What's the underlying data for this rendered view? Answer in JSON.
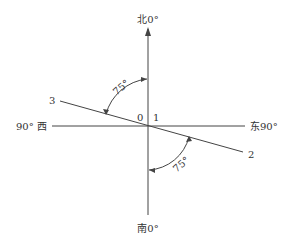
{
  "diagram": {
    "labels": {
      "north": "北0°",
      "south": "南0°",
      "west": "90° 西",
      "east": "东90°",
      "point_3": "3",
      "point_2": "2",
      "point_0": "0",
      "point_1": "1",
      "angle_upper": "75°",
      "angle_lower": "75°"
    },
    "colors": {
      "line": "#444444",
      "text": "#333333",
      "background": "#ffffff"
    }
  }
}
